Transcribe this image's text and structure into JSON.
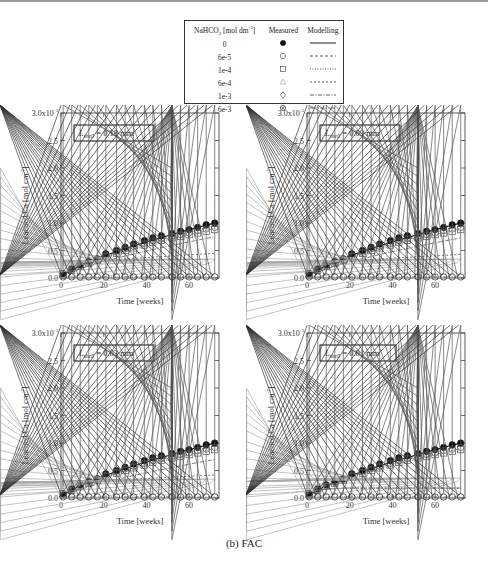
{
  "legend": {
    "headers": [
      "NaHCO3 [mol dm-3]",
      "Measured",
      "Modelling"
    ],
    "header_parts": {
      "base": "NaHCO",
      "sub": "3",
      "rest": " [mol dm",
      "sup": "-3",
      "end": "]"
    },
    "rows": [
      {
        "conc": "0",
        "marker": "filled-circle",
        "line": "solid"
      },
      {
        "conc": "6e-5",
        "marker": "open-circle",
        "line": "dash"
      },
      {
        "conc": "1e-4",
        "marker": "open-square",
        "line": "dot"
      },
      {
        "conc": "6e-4",
        "marker": "open-triangle",
        "line": "short-dash"
      },
      {
        "conc": "1e-3",
        "marker": "open-diamond",
        "line": "dash-dot"
      },
      {
        "conc": "6e-3",
        "marker": "circled-x",
        "line": "dash-dot-dot"
      }
    ]
  },
  "subfigure_label": "(b) FAC",
  "chart_data": [
    {
      "type": "scatter",
      "title": "L_shell = 0.18 mm",
      "annotation": {
        "symbol": "L",
        "sub": "shell",
        "value": " = 0.18 mm"
      },
      "xlabel": "Time [weeks]",
      "ylabel": "Leached Ca [mol cm-2]",
      "ylim": [
        0,
        0.003
      ],
      "xlim": [
        0,
        74
      ],
      "xticks": [
        "0",
        "20",
        "40",
        "60"
      ],
      "yticks": [
        "0.0",
        "0.5",
        "1.0",
        "1.5",
        "2.0",
        "2.5",
        "3.0x10-3"
      ],
      "x": [
        1,
        5,
        9,
        13,
        17,
        21,
        26,
        30,
        34,
        39,
        43,
        47,
        52,
        56,
        60,
        64,
        68,
        72
      ],
      "series": [
        {
          "name": "0",
          "measured": [
            0.08,
            0.17,
            0.24,
            0.3,
            0.35,
            0.44,
            0.5,
            0.56,
            0.62,
            0.68,
            0.73,
            0.77,
            0.81,
            0.85,
            0.88,
            0.92,
            0.97,
            1.0
          ],
          "model_end": 1.0
        },
        {
          "name": "6e-5",
          "measured": [
            0.07,
            0.15,
            0.22,
            0.28,
            0.33,
            0.41,
            0.47,
            0.53,
            0.58,
            0.63,
            0.68,
            0.72,
            0.76,
            0.79,
            0.82,
            0.86,
            0.89,
            0.92
          ],
          "model_end": 0.95
        },
        {
          "name": "1e-4",
          "measured": [
            0.07,
            0.14,
            0.21,
            0.27,
            0.32,
            0.39,
            0.45,
            0.5,
            0.55,
            0.6,
            0.65,
            0.69,
            0.73,
            0.76,
            0.79,
            0.82,
            0.85,
            0.88
          ],
          "model_end": 0.9
        },
        {
          "name": "6e-4",
          "measured": [
            0.06,
            0.12,
            0.17,
            0.21,
            0.23,
            0.25,
            0.26,
            0.27,
            0.27,
            0.28,
            0.28,
            0.28,
            0.28,
            0.28,
            0.28,
            0.28,
            0.28,
            0.28
          ],
          "model_end": 0.45
        },
        {
          "name": "1e-3",
          "measured": [
            0.02,
            0.02,
            0.02,
            0.02,
            0.02,
            0.02,
            0.02,
            0.02,
            0.02,
            0.02,
            0.02,
            0.02,
            0.02,
            0.02,
            0.02,
            0.02,
            0.02,
            0.02
          ],
          "model_end": 0.75
        },
        {
          "name": "6e-3",
          "measured": [
            0.02,
            0.02,
            0.02,
            0.02,
            0.02,
            0.02,
            0.02,
            0.02,
            0.02,
            0.02,
            0.02,
            0.02,
            0.02,
            0.02,
            0.02,
            0.02,
            0.02,
            0.02
          ],
          "model_end": 0.02
        }
      ]
    },
    {
      "type": "scatter",
      "title": "L_shell = 0.09 mm",
      "annotation": {
        "symbol": "L",
        "sub": "shell",
        "value": " = 0.09 mm"
      },
      "xlabel": "Time [weeks]",
      "ylabel": "Leached Ca [mol cm-2]",
      "ylim": [
        0,
        0.003
      ],
      "xlim": [
        0,
        74
      ],
      "xticks": [
        "0",
        "20",
        "40",
        "60"
      ],
      "yticks": [
        "0.0",
        "0.5",
        "1.0",
        "1.5",
        "2.0",
        "2.5",
        "3.0x10-3"
      ],
      "x": [
        1,
        5,
        9,
        13,
        17,
        21,
        26,
        30,
        34,
        39,
        43,
        47,
        52,
        56,
        60,
        64,
        68,
        72
      ],
      "series": [
        {
          "name": "0",
          "model_end": 1.0
        },
        {
          "name": "6e-5",
          "model_end": 0.95
        },
        {
          "name": "1e-4",
          "model_end": 0.9
        },
        {
          "name": "6e-4",
          "model_end": 0.43
        },
        {
          "name": "1e-3",
          "model_end": 0.73
        },
        {
          "name": "6e-3",
          "model_end": 0.02
        }
      ]
    },
    {
      "type": "scatter",
      "title": "L_shell = 0.03 mm",
      "annotation": {
        "symbol": "L",
        "sub": "shell",
        "value": " = 0.03 mm"
      },
      "xlabel": "Time [weeks]",
      "ylabel": "Leached Ca [mol cm-2]",
      "ylim": [
        0,
        0.003
      ],
      "xlim": [
        0,
        74
      ],
      "xticks": [
        "0",
        "20",
        "40",
        "60"
      ],
      "yticks": [
        "0.0",
        "0.5",
        "1.0",
        "1.5",
        "2.0",
        "2.5",
        "3.0x10-3"
      ],
      "x": [
        1,
        5,
        9,
        13,
        17,
        21,
        26,
        30,
        34,
        39,
        43,
        47,
        52,
        56,
        60,
        64,
        68,
        72
      ],
      "series": [
        {
          "name": "0",
          "model_end": 1.0
        },
        {
          "name": "6e-5",
          "model_end": 0.95
        },
        {
          "name": "1e-4",
          "model_end": 0.9
        },
        {
          "name": "6e-4",
          "model_end": 0.42
        },
        {
          "name": "1e-3",
          "model_end": 0.7
        },
        {
          "name": "6e-3",
          "model_end": 0.02
        }
      ]
    },
    {
      "type": "scatter",
      "title": "L_shell = 0.01 mm",
      "annotation": {
        "symbol": "L",
        "sub": "shell",
        "value": " = 0.01 mm"
      },
      "xlabel": "Time [weeks]",
      "ylabel": "Leached Ca [mol cm-2]",
      "ylim": [
        0,
        0.003
      ],
      "xlim": [
        0,
        74
      ],
      "xticks": [
        "0",
        "20",
        "40",
        "60"
      ],
      "yticks": [
        "0.0",
        "0.5",
        "1.0",
        "1.5",
        "2.0",
        "2.5",
        "3.0x10-3"
      ],
      "x": [
        1,
        5,
        9,
        13,
        17,
        21,
        26,
        30,
        34,
        39,
        43,
        47,
        52,
        56,
        60,
        64,
        68,
        72
      ],
      "series": [
        {
          "name": "0",
          "model_end": 1.0
        },
        {
          "name": "6e-5",
          "model_end": 0.95
        },
        {
          "name": "1e-4",
          "model_end": 0.9
        },
        {
          "name": "6e-4",
          "model_end": 0.18,
          "measured_plateau": 0.3
        },
        {
          "name": "1e-3",
          "model_end": 0.18
        },
        {
          "name": "6e-3",
          "model_end": 0.02
        }
      ]
    }
  ]
}
